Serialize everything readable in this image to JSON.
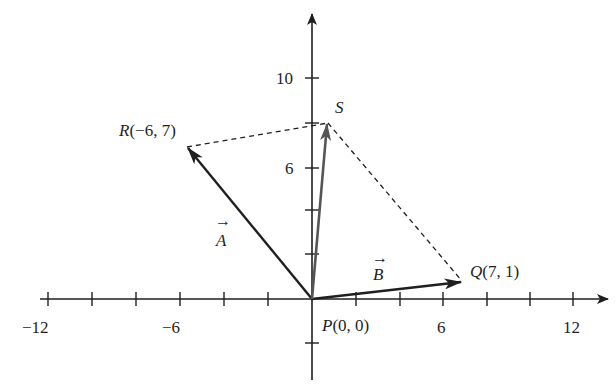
{
  "figure": {
    "type": "vector-parallelogram",
    "colors": {
      "ink": "#1f1f1f",
      "vector_s": "#555555",
      "background": "#ffffff"
    },
    "axes": {
      "x_ticks": [
        -12,
        -10,
        -8,
        -6,
        -4,
        -2,
        2,
        4,
        6,
        8,
        10,
        12
      ],
      "y_ticks": [
        -2,
        2,
        4,
        6,
        8,
        10
      ],
      "x_tick_labels": [
        "-12",
        "-6",
        "6",
        "12"
      ],
      "x_labels": {
        "neg12": "−12",
        "neg6": "−6",
        "pos6": "6",
        "pos12": "12"
      },
      "y_labels": {
        "pos10": "10",
        "pos6": "6"
      }
    },
    "points": {
      "P": {
        "name": "P",
        "x": 0,
        "y": 0,
        "label_tail": "(0, 0)"
      },
      "Q": {
        "name": "Q",
        "x": 7,
        "y": 1,
        "label_tail": "(7, 1)"
      },
      "R": {
        "name": "R",
        "x": -6,
        "y": 7,
        "label_tail": "(−6, 7)"
      },
      "S": {
        "name": "S",
        "x": 1,
        "y": 8,
        "label_tail": ""
      }
    },
    "vectors": {
      "A": {
        "name": "A",
        "arrow": "→",
        "from": "P",
        "to": "R"
      },
      "B": {
        "name": "B",
        "arrow": "→",
        "from": "P",
        "to": "Q"
      },
      "S": {
        "from": "P",
        "to": "S"
      }
    },
    "dashed_segments": [
      {
        "from": "R",
        "to": "S"
      },
      {
        "from": "S",
        "to": "Q"
      }
    ]
  }
}
